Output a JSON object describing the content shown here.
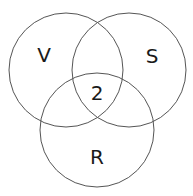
{
  "diagram": {
    "type": "venn",
    "sets": [
      {
        "label": "V",
        "cx": 66,
        "cy": 70,
        "r": 57,
        "label_x": 44,
        "label_y": 62
      },
      {
        "label": "S",
        "cx": 129,
        "cy": 70,
        "r": 57,
        "label_x": 152,
        "label_y": 63
      },
      {
        "label": "R",
        "cx": 97,
        "cy": 130,
        "r": 57,
        "label_x": 97,
        "label_y": 164
      }
    ],
    "intersection": {
      "label": "2",
      "x": 97,
      "y": 100
    },
    "stroke_color": "#555555",
    "text_color": "#1a1a1a"
  }
}
